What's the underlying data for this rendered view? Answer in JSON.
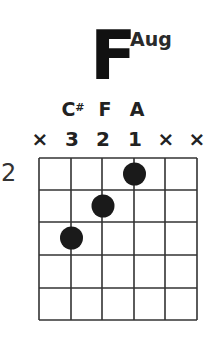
{
  "chord": {
    "root": "F",
    "quality": "Aug"
  },
  "notes": [
    {
      "string": 2,
      "label": "C#"
    },
    {
      "string": 3,
      "label": "F"
    },
    {
      "string": 4,
      "label": "A"
    }
  ],
  "note_labels": {
    "cs_main": "C",
    "cs_accidental": "#",
    "f": "F",
    "a": "A"
  },
  "string_markers": [
    "×",
    "3",
    "2",
    "1",
    "×",
    "×"
  ],
  "fret_number": "2",
  "fretboard": {
    "strings": 6,
    "frets_shown": 5,
    "start_fret": 2,
    "line_color": "#333333",
    "dot_color": "#1a1a1a"
  },
  "fingering": [
    {
      "string": 1,
      "fret": null,
      "marker": "×"
    },
    {
      "string": 2,
      "fret": 4,
      "finger": 3
    },
    {
      "string": 3,
      "fret": 3,
      "finger": 2
    },
    {
      "string": 4,
      "fret": 2,
      "finger": 1
    },
    {
      "string": 5,
      "fret": null,
      "marker": "×"
    },
    {
      "string": 6,
      "fret": null,
      "marker": "×"
    }
  ]
}
